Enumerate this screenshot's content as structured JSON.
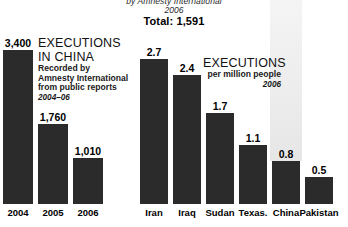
{
  "header": {
    "source_line": "by Amnesty International",
    "year_line": "2006",
    "total_line": "Total: 1,591"
  },
  "left_panel": {
    "title_line1": "EXECUTIONS",
    "title_line2": "IN CHINA",
    "sub_line1": "Recorded by",
    "sub_line2": "Amnesty International",
    "sub_line3": "from public reports",
    "period": "2004–06"
  },
  "right_panel": {
    "title": "EXECUTIONS",
    "subtitle": "per million people",
    "year": "2006"
  },
  "colors": {
    "bar": "#2b2b2b",
    "highlight_band": "#ededed",
    "background": "#ffffff",
    "text": "#111111"
  },
  "chart_data": [
    {
      "type": "bar",
      "title": "EXECUTIONS IN CHINA",
      "subtitle": "Recorded by Amnesty International from public reports",
      "annotation": "2004–06",
      "xlabel": "",
      "ylabel": "",
      "categories": [
        "2004",
        "2005",
        "2006"
      ],
      "values": [
        3400,
        1760,
        1010
      ],
      "value_labels": [
        "3,400",
        "1,760",
        "1,010"
      ],
      "ylim": [
        0,
        3400
      ],
      "grid": false,
      "legend": "none"
    },
    {
      "type": "bar",
      "title": "EXECUTIONS",
      "subtitle": "per million people",
      "annotation": "2006",
      "xlabel": "",
      "ylabel": "",
      "categories": [
        "Iran",
        "Iraq",
        "Sudan",
        "Texas.",
        "China",
        "Pakistan"
      ],
      "values": [
        2.7,
        2.4,
        1.7,
        1.1,
        0.8,
        0.5
      ],
      "value_labels": [
        "2.7",
        "2.4",
        "1.7",
        "1.1",
        "0.8",
        "0.5"
      ],
      "ylim": [
        0,
        2.7
      ],
      "grid": false,
      "legend": "none",
      "highlighted_category": "China"
    }
  ]
}
